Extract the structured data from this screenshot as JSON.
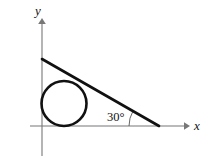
{
  "figure": {
    "background_color": "#ffffff",
    "width": 205,
    "height": 158,
    "stroke_color": "#111111",
    "axis_color": "#777777",
    "axis_labels": {
      "x": "x",
      "y": "y"
    },
    "annotations": {
      "angle": "30°"
    },
    "geometry": {
      "x_axis": {
        "y": 126,
        "x_start": 30,
        "x_end": 188,
        "arrow": "right"
      },
      "y_axis": {
        "x": 42,
        "y_start": 20,
        "y_end": 155,
        "arrow": "up"
      },
      "circle": {
        "cx": 64,
        "cy": 103.5,
        "r": 22.5
      },
      "line": {
        "x1": 42,
        "y1": 59,
        "x2": 159,
        "y2": 126
      },
      "angle_arc": {
        "cx": 159,
        "cy": 126,
        "r": 30,
        "from_deg": 150,
        "to_deg": 180
      },
      "angle_label_pos": {
        "x": 107,
        "y": 121
      },
      "x_label_pos": {
        "x": 194,
        "y": 130
      },
      "y_label_pos": {
        "x": 35,
        "y": 15
      }
    }
  }
}
